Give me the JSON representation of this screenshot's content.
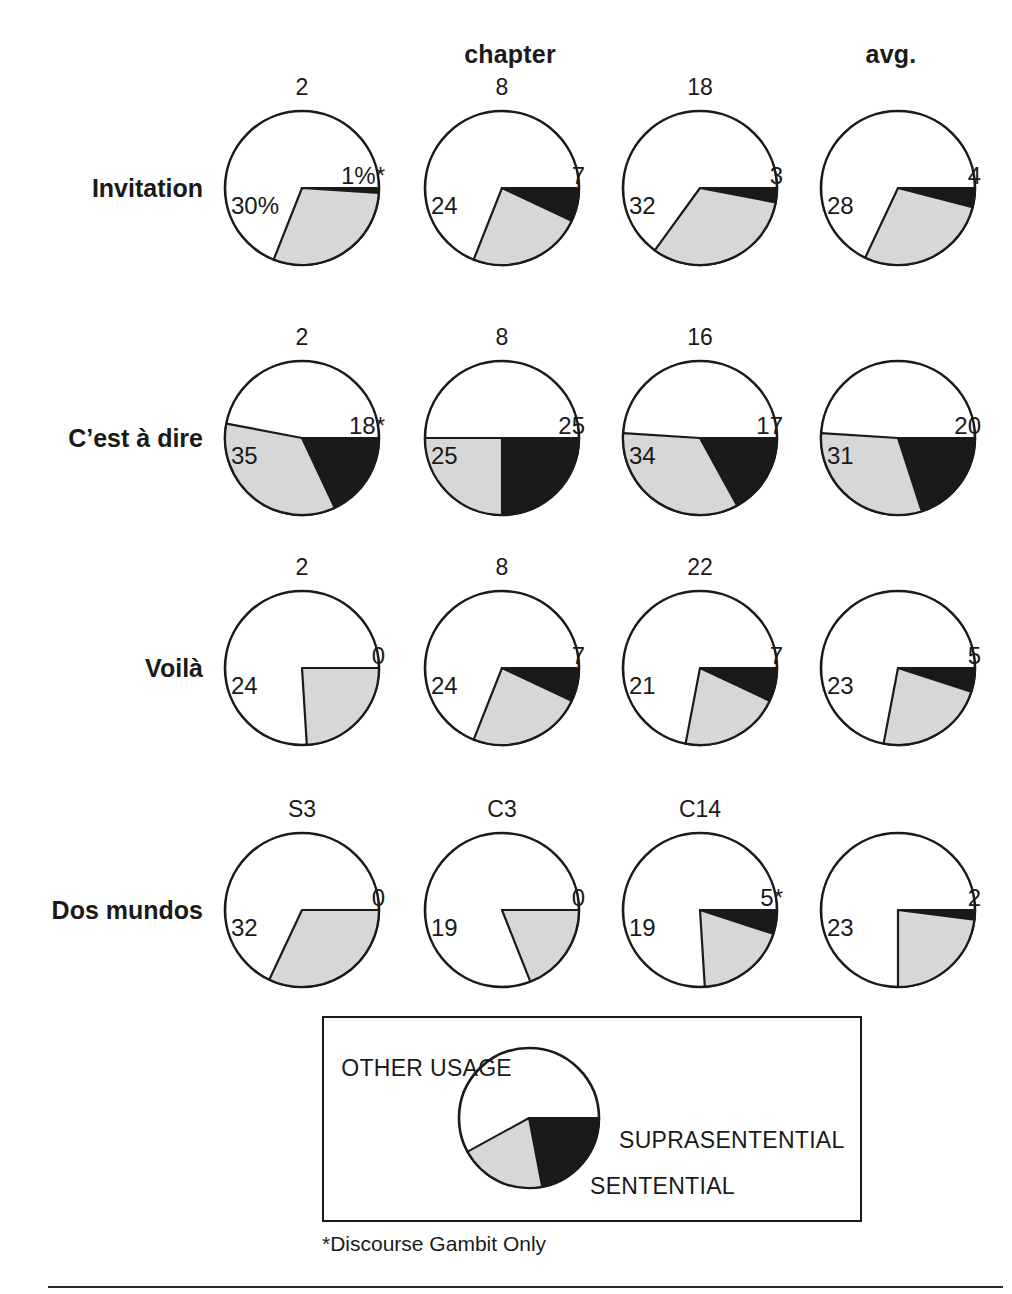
{
  "figure": {
    "header_chapter": "chapter",
    "header_avg": "avg.",
    "footnote": "*Discourse Gambit Only"
  },
  "legend": {
    "other": "OTHER USAGE",
    "supra": "SUPRASENTENTIAL",
    "sentential": "SENTENTIAL",
    "colors": {
      "suprasentential": "#1a1a1a",
      "sentential": "#d7d7d7",
      "other_usage": "#ffffff",
      "outline": "#1a1a1a"
    },
    "pie": {
      "suprasentential": 22,
      "sentential": 20,
      "other_usage": 58
    }
  },
  "chart_data": {
    "type": "pie",
    "title": "",
    "xlabel": "",
    "ylabel": "",
    "legend_position": "bottom",
    "grid": false,
    "column_group_labels": [
      "chapter",
      "avg."
    ],
    "categories": [
      "SUPRASENTENTIAL",
      "SENTENTIAL",
      "OTHER USAGE"
    ],
    "colors": [
      "#1a1a1a",
      "#d7d7d7",
      "#ffffff"
    ],
    "note": "*Discourse Gambit Only",
    "rows": [
      {
        "label": "Invitation",
        "pies": [
          {
            "column": "2",
            "suprasentential": 1,
            "sentential": 30,
            "other": 69,
            "label_supra": "1%*",
            "label_sent": "30%"
          },
          {
            "column": "8",
            "suprasentential": 7,
            "sentential": 24,
            "other": 69,
            "label_supra": "7",
            "label_sent": "24"
          },
          {
            "column": "18",
            "suprasentential": 3,
            "sentential": 32,
            "other": 65,
            "label_supra": "3",
            "label_sent": "32"
          },
          {
            "column": "",
            "suprasentential": 4,
            "sentential": 28,
            "other": 68,
            "label_supra": "4",
            "label_sent": "28"
          }
        ]
      },
      {
        "label": "C’est à dire",
        "pies": [
          {
            "column": "2",
            "suprasentential": 18,
            "sentential": 35,
            "other": 47,
            "label_supra": "18*",
            "label_sent": "35"
          },
          {
            "column": "8",
            "suprasentential": 25,
            "sentential": 25,
            "other": 50,
            "label_supra": "25",
            "label_sent": "25"
          },
          {
            "column": "16",
            "suprasentential": 17,
            "sentential": 34,
            "other": 49,
            "label_supra": "17",
            "label_sent": "34"
          },
          {
            "column": "",
            "suprasentential": 20,
            "sentential": 31,
            "other": 49,
            "label_supra": "20",
            "label_sent": "31"
          }
        ]
      },
      {
        "label": "Voilà",
        "pies": [
          {
            "column": "2",
            "suprasentential": 0,
            "sentential": 24,
            "other": 76,
            "label_supra": "0",
            "label_sent": "24"
          },
          {
            "column": "8",
            "suprasentential": 7,
            "sentential": 24,
            "other": 69,
            "label_supra": "7",
            "label_sent": "24"
          },
          {
            "column": "22",
            "suprasentential": 7,
            "sentential": 21,
            "other": 72,
            "label_supra": "7",
            "label_sent": "21"
          },
          {
            "column": "",
            "suprasentential": 5,
            "sentential": 23,
            "other": 72,
            "label_supra": "5",
            "label_sent": "23"
          }
        ]
      },
      {
        "label": "Dos mundos",
        "pies": [
          {
            "column": "S3",
            "suprasentential": 0,
            "sentential": 32,
            "other": 68,
            "label_supra": "0",
            "label_sent": "32"
          },
          {
            "column": "C3",
            "suprasentential": 0,
            "sentential": 19,
            "other": 81,
            "label_supra": "0",
            "label_sent": "19"
          },
          {
            "column": "C14",
            "suprasentential": 5,
            "sentential": 19,
            "other": 76,
            "label_supra": "5*",
            "label_sent": "19"
          },
          {
            "column": "",
            "suprasentential": 2,
            "sentential": 23,
            "other": 75,
            "label_supra": "2",
            "label_sent": "23"
          }
        ]
      }
    ]
  }
}
